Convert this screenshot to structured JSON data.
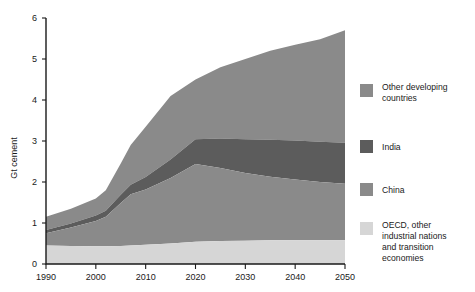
{
  "chart_data": {
    "type": "area",
    "stacked": true,
    "title": "",
    "xlabel": "",
    "ylabel": "Gt cement",
    "xlim": [
      1990,
      2050
    ],
    "ylim": [
      0,
      6
    ],
    "xticks": [
      1990,
      2000,
      2010,
      2020,
      2030,
      2040,
      2050
    ],
    "yticks": [
      0,
      1,
      2,
      3,
      4,
      5,
      6
    ],
    "grid": false,
    "legend_position": "right",
    "x": [
      1990,
      1995,
      2000,
      2002,
      2005,
      2007,
      2010,
      2015,
      2020,
      2025,
      2030,
      2035,
      2040,
      2045,
      2050
    ],
    "series": [
      {
        "name": "OECD, other industrial nations and transition economies",
        "color": "#d6d6d6",
        "values": [
          0.45,
          0.44,
          0.43,
          0.43,
          0.44,
          0.45,
          0.47,
          0.5,
          0.54,
          0.56,
          0.57,
          0.58,
          0.58,
          0.58,
          0.58
        ]
      },
      {
        "name": "China",
        "color": "#8a8a8a",
        "values": [
          0.3,
          0.45,
          0.62,
          0.72,
          1.05,
          1.25,
          1.35,
          1.6,
          1.9,
          1.78,
          1.65,
          1.55,
          1.48,
          1.42,
          1.38
        ]
      },
      {
        "name": "India",
        "color": "#5c5c5c",
        "values": [
          0.08,
          0.1,
          0.13,
          0.15,
          0.2,
          0.23,
          0.3,
          0.45,
          0.6,
          0.72,
          0.82,
          0.9,
          0.95,
          0.98,
          1.0
        ]
      },
      {
        "name": "Other developing countries",
        "color": "#8a8a8a",
        "values": [
          0.32,
          0.36,
          0.42,
          0.5,
          0.76,
          0.97,
          1.23,
          1.55,
          1.46,
          1.74,
          1.96,
          2.17,
          2.34,
          2.5,
          2.74
        ]
      }
    ],
    "totals": [
      1.15,
      1.35,
      1.6,
      1.8,
      2.45,
      2.9,
      3.35,
      4.1,
      4.5,
      4.8,
      5.0,
      5.2,
      5.35,
      5.48,
      5.7
    ]
  },
  "legend": {
    "items": [
      {
        "label_line1": "Other developing",
        "label_line2": "countries",
        "color": "#8a8a8a"
      },
      {
        "label_line1": "India",
        "label_line2": "",
        "color": "#5c5c5c"
      },
      {
        "label_line1": "China",
        "label_line2": "",
        "color": "#8a8a8a"
      },
      {
        "label_line1": "OECD, other",
        "label_line2": "industrial nations",
        "label_line3": "and transition",
        "label_line4": "economies",
        "color": "#d6d6d6"
      }
    ]
  },
  "axis": {
    "ylabel": "Gt cement",
    "ytick_labels": [
      "0",
      "1",
      "2",
      "3",
      "4",
      "5",
      "6"
    ],
    "xtick_labels": [
      "1990",
      "2000",
      "2010",
      "2020",
      "2030",
      "2040",
      "2050"
    ]
  }
}
